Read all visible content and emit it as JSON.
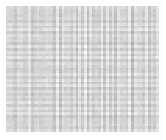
{
  "figure": {
    "title": "",
    "background_color": "#ffffff",
    "canvas_width": 166,
    "canvas_height": 140
  },
  "plot_area": {
    "left": 6,
    "top": 6,
    "width": 153,
    "height": 126,
    "cell_pitch_px": 2.8
  },
  "chart_data": {
    "type": "heatmap",
    "title": "",
    "subtitle": "",
    "xlabel": "",
    "ylabel": "",
    "legend": [],
    "legend_position": "none",
    "grid": false,
    "axis_visible": false,
    "tick_labels_x": [],
    "tick_labels_y": [],
    "n_cols": 55,
    "n_rows": 45,
    "colormap": "grayscale",
    "value_min": 0,
    "value_max": 1,
    "color_min": "#999999",
    "color_max": "#f7f7f7",
    "color_mean": "#c8c8c8",
    "row_weights": [
      0.52,
      0.34,
      0.71,
      0.44,
      0.29,
      0.63,
      0.38,
      0.55,
      0.26,
      0.68,
      0.41,
      0.33,
      0.59,
      0.47,
      0.3,
      0.66,
      0.36,
      0.57,
      0.28,
      0.72,
      0.43,
      0.31,
      0.61,
      0.49,
      0.35,
      0.64,
      0.39,
      0.53,
      0.27,
      0.69,
      0.45,
      0.32,
      0.58,
      0.5,
      0.37,
      0.65,
      0.4,
      0.56,
      0.29,
      0.7,
      0.46,
      0.33,
      0.6,
      0.48,
      0.42
    ],
    "col_weights": [
      0.58,
      0.3,
      0.66,
      0.38,
      0.52,
      0.27,
      0.71,
      0.43,
      0.34,
      0.61,
      0.47,
      0.29,
      0.68,
      0.4,
      0.55,
      0.32,
      0.64,
      0.45,
      0.28,
      0.7,
      0.41,
      0.36,
      0.59,
      0.5,
      0.31,
      0.67,
      0.39,
      0.54,
      0.26,
      0.72,
      0.44,
      0.33,
      0.62,
      0.48,
      0.3,
      0.65,
      0.37,
      0.57,
      0.29,
      0.69,
      0.42,
      0.35,
      0.6,
      0.49,
      0.27,
      0.63,
      0.46,
      0.31,
      0.56,
      0.51,
      0.34,
      0.66,
      0.4,
      0.53,
      0.44
    ]
  }
}
